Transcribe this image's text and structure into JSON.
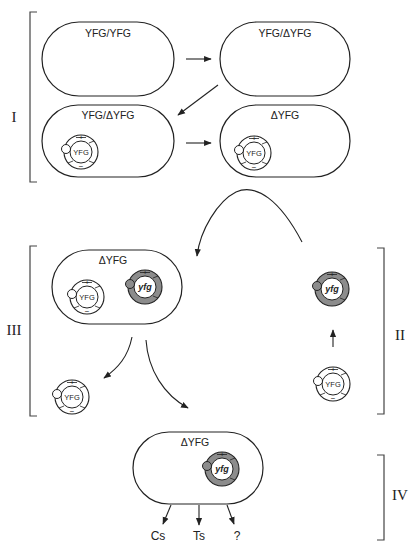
{
  "diagram": {
    "type": "plasmid-shuffle-workflow",
    "stages": [
      {
        "id": "I",
        "label": "I"
      },
      {
        "id": "II",
        "label": "II"
      },
      {
        "id": "III",
        "label": "III"
      },
      {
        "id": "IV",
        "label": "IV"
      }
    ],
    "cells": {
      "stage1_a": {
        "genotype": "YFG/YFG"
      },
      "stage1_b": {
        "genotype": "YFG/ΔYFG"
      },
      "stage1_c": {
        "genotype": "YFG/ΔYFG",
        "plasmid": "YFG"
      },
      "stage1_d": {
        "genotype": "ΔYFG",
        "plasmid": "YFG"
      },
      "stage3": {
        "genotype": "ΔYFG",
        "plasmids": [
          "YFG",
          "yfg"
        ]
      },
      "stage4": {
        "genotype": "ΔYFG",
        "plasmid": "yfg"
      }
    },
    "plasmids": {
      "wildtype_label": "YFG",
      "mutant_label": "yfg",
      "plus_marker": "+",
      "minus_marker": "−"
    },
    "stage2": {
      "top_plasmid": "yfg",
      "bottom_plasmid": "YFG"
    },
    "stage3_lost_plasmid": "YFG",
    "outcomes": [
      "Cs",
      "Ts",
      "?"
    ],
    "colors": {
      "line": "#222222",
      "mutant_fill": "#8c8c8c",
      "background": "#ffffff"
    }
  }
}
